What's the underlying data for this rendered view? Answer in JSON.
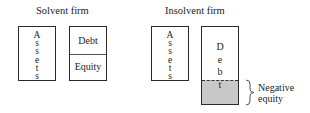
{
  "diagram": {
    "solvent": {
      "title": "Solvent firm",
      "assets_letters": [
        "A",
        "s",
        "s",
        "e",
        "t",
        "s"
      ],
      "debt_label": "Debt",
      "equity_label": "Equity"
    },
    "insolvent": {
      "title": "Insolvent firm",
      "assets_letters": [
        "A",
        "s",
        "s",
        "e",
        "t",
        "s"
      ],
      "debt_letters": [
        "D",
        "e",
        "b",
        "t"
      ],
      "negative_equity_line1": "Negative",
      "negative_equity_line2": "equity",
      "negative_equity_fill": "#c8c8c8"
    }
  }
}
